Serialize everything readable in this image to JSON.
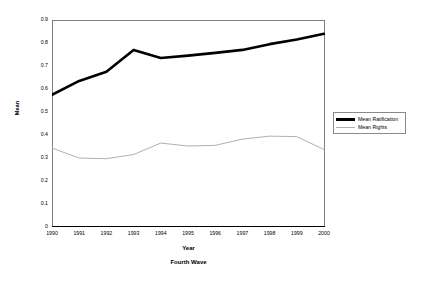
{
  "chart_data": {
    "type": "line",
    "title": "",
    "subtitle": "",
    "caption": "Fourth Wave",
    "xlabel": "Year",
    "ylabel": "Mean",
    "grid": false,
    "legend_position": "right",
    "categories": [
      "1990",
      "1991",
      "1992",
      "1993",
      "1994",
      "1995",
      "1996",
      "1997",
      "1998",
      "1999",
      "2000"
    ],
    "x": [
      1990,
      1991,
      1992,
      1993,
      1994,
      1995,
      1996,
      1997,
      1998,
      1999,
      2000
    ],
    "xlim": [
      1990,
      2000
    ],
    "ylim": [
      0,
      0.9
    ],
    "yticks": [
      "0",
      "0.1",
      "0.2",
      "0.3",
      "0.4",
      "0.5",
      "0.6",
      "0.7",
      "0.8",
      "0.9"
    ],
    "ytick_values": [
      0,
      0.1,
      0.2,
      0.3,
      0.4,
      0.5,
      0.6,
      0.7,
      0.8,
      0.9
    ],
    "series": [
      {
        "name": "Mean Ratification",
        "color": "#000000",
        "width": 2.6,
        "values": [
          0.575,
          0.635,
          0.675,
          0.77,
          0.735,
          0.745,
          0.757,
          0.77,
          0.795,
          0.815,
          0.84
        ]
      },
      {
        "name": "Mean Rights",
        "color": "#b0b0b0",
        "width": 1.0,
        "values": [
          0.343,
          0.3,
          0.297,
          0.315,
          0.365,
          0.352,
          0.355,
          0.382,
          0.395,
          0.393,
          0.337
        ]
      }
    ]
  },
  "legend": {
    "items": [
      {
        "label": "Mean Ratification"
      },
      {
        "label": "Mean Rights"
      }
    ]
  },
  "axes": {
    "frame_color": "#808080",
    "tick_color": "#808080"
  }
}
